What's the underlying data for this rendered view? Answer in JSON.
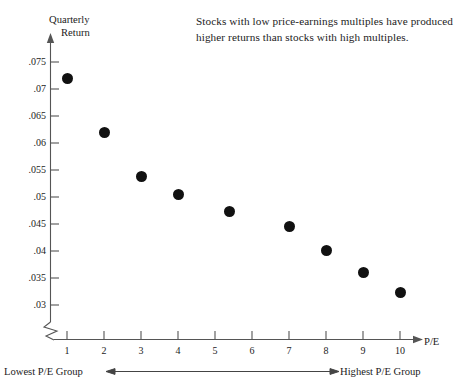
{
  "chart_data": {
    "type": "scatter",
    "title": "",
    "annotation": "Stocks with low price-earnings multiples have produced higher returns than stocks with high multiples.",
    "xlabel": "P/E",
    "ylabel_line1": "Quarterly",
    "ylabel_line2": "Return",
    "x": [
      1,
      2,
      3,
      4,
      5.4,
      7,
      8,
      9,
      10
    ],
    "values": [
      0.072,
      0.062,
      0.0538,
      0.0505,
      0.0474,
      0.0446,
      0.0401,
      0.0361,
      0.0323
    ],
    "xticks": [
      "1",
      "2",
      "3",
      "4",
      "5",
      "6",
      "7",
      "8",
      "9",
      "10"
    ],
    "yticks": [
      ".03",
      ".035",
      ".04",
      ".045",
      ".05",
      ".055",
      ".06",
      ".065",
      ".07",
      ".075"
    ],
    "xlim": [
      0,
      10.6
    ],
    "ylim": [
      0.03,
      0.0775
    ],
    "grid": false,
    "legend": null,
    "axis_break": true,
    "footer_left": "Lowest P/E Group",
    "footer_right": "Highest P/E Group",
    "marker_color": "#111111",
    "axis_color": "#555555"
  }
}
